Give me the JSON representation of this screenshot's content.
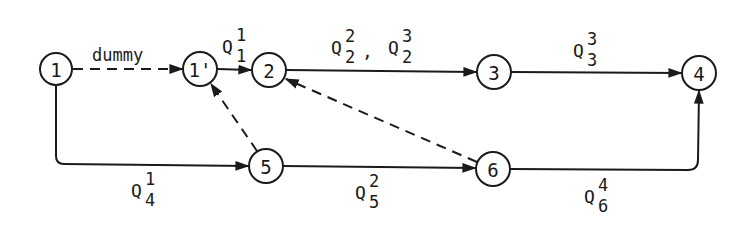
{
  "diagram": {
    "type": "network-flow",
    "nodes": [
      {
        "id": "1",
        "label": "1",
        "x": 56,
        "y": 69
      },
      {
        "id": "1p",
        "label": "1'",
        "x": 200,
        "y": 69
      },
      {
        "id": "2",
        "label": "2",
        "x": 269,
        "y": 70
      },
      {
        "id": "3",
        "label": "3",
        "x": 494,
        "y": 72
      },
      {
        "id": "4",
        "label": "4",
        "x": 699,
        "y": 73
      },
      {
        "id": "5",
        "label": "5",
        "x": 266,
        "y": 166
      },
      {
        "id": "6",
        "label": "6",
        "x": 493,
        "y": 169
      }
    ],
    "edges": [
      {
        "from": "1",
        "to": "1p",
        "style": "dashed",
        "label": "dummy"
      },
      {
        "from": "1p",
        "to": "2",
        "style": "solid",
        "label": {
          "base": "Q",
          "sup": "1",
          "sub": "1"
        }
      },
      {
        "from": "2",
        "to": "3",
        "style": "solid",
        "label": [
          {
            "base": "Q",
            "sup": "2",
            "sub": "2"
          },
          {
            "base": "Q",
            "sup": "3",
            "sub": "2"
          }
        ]
      },
      {
        "from": "3",
        "to": "4",
        "style": "solid",
        "label": {
          "base": "Q",
          "sup": "3",
          "sub": "3"
        }
      },
      {
        "from": "1",
        "to": "5",
        "style": "solid",
        "label": {
          "base": "Q",
          "sup": "1",
          "sub": "4"
        }
      },
      {
        "from": "5",
        "to": "1p",
        "style": "dashed",
        "label": ""
      },
      {
        "from": "5",
        "to": "6",
        "style": "solid",
        "label": {
          "base": "Q",
          "sup": "2",
          "sub": "5"
        }
      },
      {
        "from": "6",
        "to": "2",
        "style": "dashed",
        "label": ""
      },
      {
        "from": "6",
        "to": "4",
        "style": "solid",
        "label": {
          "base": "Q",
          "sup": "4",
          "sub": "6"
        }
      }
    ]
  },
  "labels": {
    "dummy": "dummy",
    "q11": {
      "base": "Q",
      "sup": "1",
      "sub": "1"
    },
    "q22": {
      "base": "Q",
      "sup": "2",
      "sub": "2"
    },
    "comma": ",",
    "q32": {
      "base": "Q",
      "sup": "3",
      "sub": "2"
    },
    "q33": {
      "base": "Q",
      "sup": "3",
      "sub": "3"
    },
    "q14": {
      "base": "Q",
      "sup": "1",
      "sub": "4"
    },
    "q25": {
      "base": "Q",
      "sup": "2",
      "sub": "5"
    },
    "q46": {
      "base": "Q",
      "sup": "4",
      "sub": "6"
    }
  },
  "node_labels": {
    "n1": "1",
    "n1p": "1'",
    "n2": "2",
    "n3": "3",
    "n4": "4",
    "n5": "5",
    "n6": "6"
  }
}
